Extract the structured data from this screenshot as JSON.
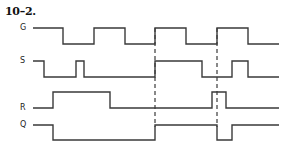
{
  "title": "10–2.",
  "colors": {
    "line": "#3a3a3a",
    "dash": "#3a3a3a"
  },
  "signals": [
    {
      "label": "G",
      "high_y": 28,
      "low_y": 44,
      "start_level": "high",
      "start_x": 33,
      "end_x": 279,
      "transitions": [
        63,
        94,
        125,
        155,
        186,
        217,
        248
      ]
    },
    {
      "label": "S",
      "high_y": 61,
      "low_y": 77,
      "start_level": "high",
      "start_x": 33,
      "end_x": 279,
      "transitions": [
        44,
        76,
        84,
        155,
        202,
        232,
        248
      ]
    },
    {
      "label": "R",
      "high_y": 92,
      "low_y": 108,
      "start_level": "low",
      "start_x": 33,
      "end_x": 279,
      "transitions": [
        53,
        110,
        212,
        226
      ]
    },
    {
      "label": "Q",
      "high_y": 125,
      "low_y": 140,
      "start_level": "high",
      "start_x": 33,
      "end_x": 279,
      "transitions": [
        53,
        155,
        217,
        232
      ]
    }
  ],
  "dashed_markers": [
    {
      "x": 155,
      "y1": 28,
      "y2": 127
    },
    {
      "x": 217,
      "y1": 28,
      "y2": 127
    }
  ]
}
